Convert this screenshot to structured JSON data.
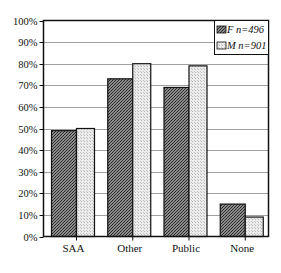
{
  "chart_data": {
    "type": "bar",
    "title": "",
    "xlabel": "",
    "ylabel": "",
    "categories": [
      "SAA",
      "Other",
      "Public",
      "None"
    ],
    "series": [
      {
        "name": "F n=496",
        "values": [
          49,
          73,
          69,
          15
        ],
        "fill": "#6e6e6e",
        "pattern": "dark-dotted"
      },
      {
        "name": "M n=901",
        "values": [
          50,
          80,
          79,
          9
        ],
        "fill": "#d9d9d9",
        "pattern": "light-dotted"
      }
    ],
    "ylim": [
      0,
      100
    ],
    "yticks": [
      "0%",
      "10%",
      "20%",
      "30%",
      "40%",
      "50%",
      "60%",
      "70%",
      "80%",
      "90%",
      "100%"
    ],
    "grid": true,
    "legend_position": "top-right-inside"
  },
  "legend": {
    "items": [
      {
        "label": "F n=496"
      },
      {
        "label": "M n=901"
      }
    ]
  }
}
